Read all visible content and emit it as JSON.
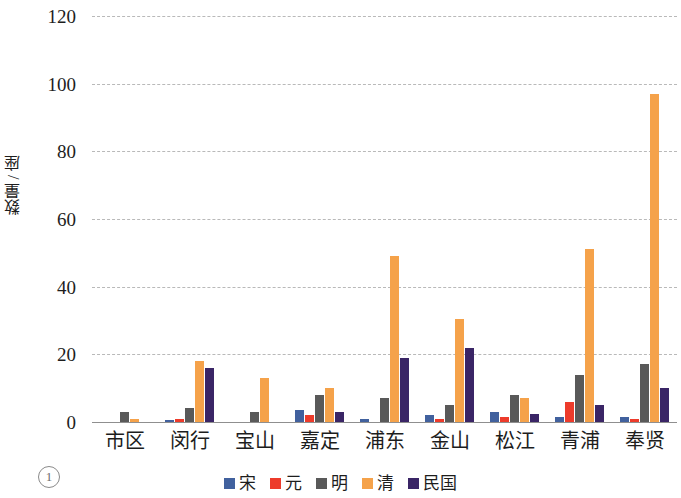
{
  "figure": {
    "marker": "1"
  },
  "axes": {
    "y_title": "数量 / 座",
    "y_ticks": [
      "0",
      "20",
      "40",
      "60",
      "80",
      "100",
      "120"
    ]
  },
  "chart_data": {
    "type": "bar",
    "title": "",
    "xlabel": "",
    "ylabel": "数量 / 座",
    "ylim": [
      0,
      120
    ],
    "ytick_step": 20,
    "grid": true,
    "legend_position": "bottom",
    "categories": [
      "市区",
      "闵行",
      "宝山",
      "嘉定",
      "浦东",
      "金山",
      "松江",
      "青浦",
      "奉贤"
    ],
    "series": [
      {
        "name": "宋",
        "color": "#41619e",
        "values": [
          0,
          0.5,
          0,
          3.5,
          1,
          2,
          3,
          1.5,
          1.5
        ]
      },
      {
        "name": "元",
        "color": "#ed3b2b",
        "values": [
          0,
          1,
          0,
          2,
          0,
          1,
          1.5,
          6,
          1
        ]
      },
      {
        "name": "明",
        "color": "#595959",
        "values": [
          3,
          4,
          3,
          8,
          7,
          5,
          8,
          14,
          17
        ]
      },
      {
        "name": "清",
        "color": "#f5a24a",
        "values": [
          1,
          18,
          13,
          10,
          49,
          30.5,
          7,
          51,
          97
        ]
      },
      {
        "name": "民国",
        "color": "#3a2566",
        "values": [
          0,
          16,
          0,
          3,
          19,
          22,
          2.5,
          5,
          10
        ]
      }
    ]
  },
  "legend": {
    "items": [
      {
        "label": "宋",
        "color": "#41619e"
      },
      {
        "label": "元",
        "color": "#ed3b2b"
      },
      {
        "label": "明",
        "color": "#595959"
      },
      {
        "label": "清",
        "color": "#f5a24a"
      },
      {
        "label": "民国",
        "color": "#3a2566"
      }
    ]
  }
}
